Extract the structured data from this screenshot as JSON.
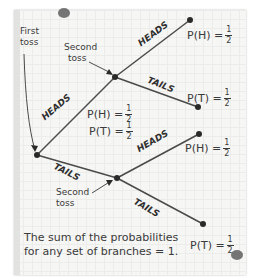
{
  "diagram": {
    "type": "probability-tree",
    "labels": {
      "first_toss": [
        "First",
        "toss"
      ],
      "second_toss_top": [
        "Second",
        "toss"
      ],
      "second_toss_bottom": [
        "Second",
        "toss"
      ]
    },
    "branches": {
      "first_heads": "HEADS",
      "first_tails": "TAILS",
      "second_top_heads": "HEADS",
      "second_top_tails": "TAILS",
      "second_bottom_heads": "HEADS",
      "second_bottom_tails": "TAILS"
    },
    "probabilities": {
      "top_heads": {
        "label": "P(H) =",
        "num": "1",
        "den": "2"
      },
      "top_tails": {
        "label": "P(T) =",
        "num": "1",
        "den": "2"
      },
      "mid_heads": {
        "label": "P(H) =",
        "num": "1",
        "den": "2"
      },
      "mid_tails": {
        "label": "P(T) =",
        "num": "1",
        "den": "2"
      },
      "bottom_heads": {
        "label": "P(H) =",
        "num": "1",
        "den": "2"
      },
      "bottom_tails": {
        "label": "P(T) =",
        "num": "1",
        "den": "2"
      }
    },
    "note": [
      "The sum of the probabilities",
      "for any set of branches = 1."
    ]
  }
}
